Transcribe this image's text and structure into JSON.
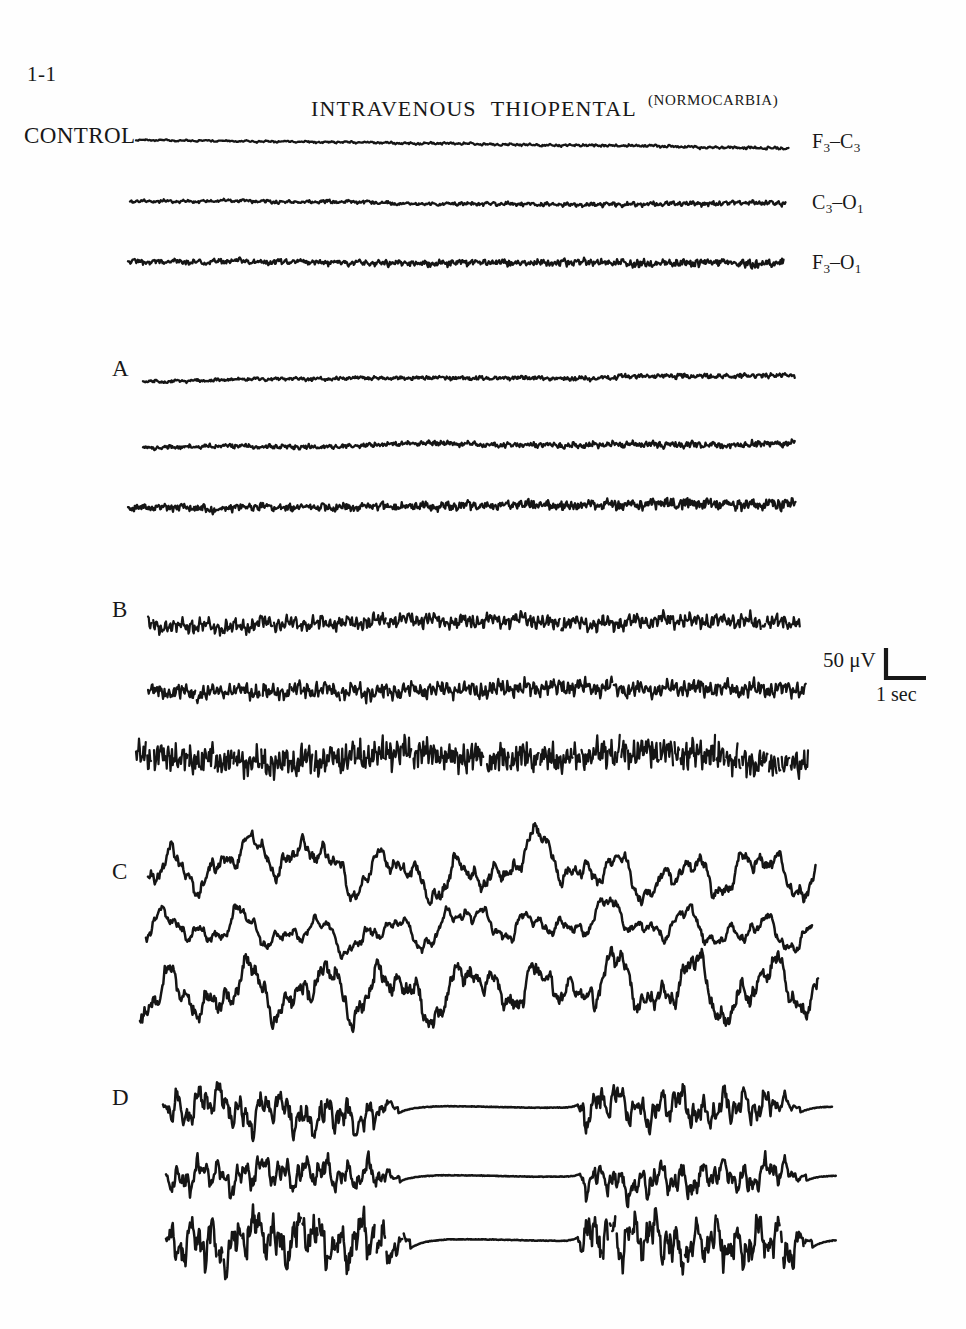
{
  "figure": {
    "number": "1-1",
    "control_label": "CONTROL",
    "title_main_part1": "INTRAVENOUS",
    "title_main_part2": "THIOPENTAL",
    "title_condition": "(NORMOCARBIA)"
  },
  "channels": [
    {
      "id": "f3-c3",
      "numerator": "F",
      "num_sub": "3",
      "dash": "–",
      "denominator": "C",
      "den_sub": "3",
      "full": "F3–C3"
    },
    {
      "id": "c3-o1",
      "numerator": "C",
      "num_sub": "3",
      "dash": "–",
      "denominator": "O",
      "den_sub": "1",
      "full": "C3–O1"
    },
    {
      "id": "f3-o1",
      "numerator": "F",
      "num_sub": "3",
      "dash": "–",
      "denominator": "O",
      "den_sub": "1",
      "full": "F3–O1"
    }
  ],
  "calibration": {
    "amplitude": "50 μV",
    "time": "1 sec"
  },
  "panels": [
    {
      "id": "control",
      "label": "",
      "label_visible": false
    },
    {
      "id": "a",
      "label": "A",
      "label_visible": true
    },
    {
      "id": "b",
      "label": "B",
      "label_visible": true
    },
    {
      "id": "c",
      "label": "C",
      "label_visible": true
    },
    {
      "id": "d",
      "label": "D",
      "label_visible": true
    }
  ],
  "colors": {
    "ink": "#181818",
    "trace": "#151515",
    "background": "#fefefe"
  },
  "chart_data": {
    "type": "line",
    "xlabel": "time",
    "ylabel": "amplitude (μV)",
    "grid": false,
    "legend_position": "right",
    "calibration_amplitude_uv": 50,
    "calibration_time_sec": 1,
    "channel_names": [
      "F3–C3",
      "C3–O1",
      "F3–O1"
    ],
    "panel_names": [
      "CONTROL",
      "A",
      "B",
      "C",
      "D"
    ],
    "panel_descriptions": [
      "CONTROL: low-voltage fast background activity, near-flat baseline",
      "A: low-voltage activity with occasional transients, increasing fast activity to the right",
      "B: prominent fast beta activity, high frequency, moderate amplitude",
      "C: high-amplitude slow delta activity, large slow waves",
      "D: burst-suppression pattern, bursts alternating with isoelectric suppression"
    ],
    "traces": [
      {
        "panel": "CONTROL",
        "channel": "F3–C3",
        "x_start_px": 136,
        "x_end_px": 789,
        "baseline_y_px": 140,
        "amplitude_scale": 0.26,
        "noise_density": 1.0,
        "style": "lowvolt-fast",
        "drift": [
          0,
          8
        ],
        "seed": 11
      },
      {
        "panel": "CONTROL",
        "channel": "C3–O1",
        "x_start_px": 130,
        "x_end_px": 786,
        "baseline_y_px": 201,
        "amplitude_scale": 0.42,
        "noise_density": 1.25,
        "style": "lowvolt-fast",
        "drift": [
          0,
          4
        ],
        "seed": 23
      },
      {
        "panel": "CONTROL",
        "channel": "F3–O1",
        "x_start_px": 128,
        "x_end_px": 784,
        "baseline_y_px": 261,
        "amplitude_scale": 0.62,
        "noise_density": 1.7,
        "style": "lowvolt-fast",
        "drift": [
          0,
          2
        ],
        "seed": 37
      },
      {
        "panel": "A",
        "channel": "F3–C3",
        "x_start_px": 143,
        "x_end_px": 795,
        "baseline_y_px": 381,
        "amplitude_scale": 0.4,
        "noise_density": 1.5,
        "style": "lowvolt-fast",
        "drift": [
          0,
          -6
        ],
        "seed": 53
      },
      {
        "panel": "A",
        "channel": "C3–O1",
        "x_start_px": 143,
        "x_end_px": 795,
        "baseline_y_px": 448,
        "amplitude_scale": 0.5,
        "noise_density": 1.7,
        "style": "lowvolt-fast",
        "drift": [
          0,
          -5
        ],
        "seed": 67
      },
      {
        "panel": "A",
        "channel": "F3–O1",
        "x_start_px": 128,
        "x_end_px": 796,
        "baseline_y_px": 508,
        "amplitude_scale": 0.72,
        "noise_density": 2.2,
        "style": "lowvolt-fast",
        "drift": [
          0,
          -4
        ],
        "seed": 79
      },
      {
        "panel": "B",
        "channel": "F3–C3",
        "x_start_px": 148,
        "x_end_px": 800,
        "baseline_y_px": 625,
        "amplitude_scale": 1.25,
        "noise_density": 3.4,
        "style": "beta-fast",
        "drift": [
          0,
          -6
        ],
        "seed": 97
      },
      {
        "panel": "B",
        "channel": "C3–O1",
        "x_start_px": 148,
        "x_end_px": 806,
        "baseline_y_px": 691,
        "amplitude_scale": 1.35,
        "noise_density": 3.6,
        "style": "beta-fast",
        "drift": [
          0,
          -3
        ],
        "seed": 113
      },
      {
        "panel": "B",
        "channel": "F3–O1",
        "x_start_px": 136,
        "x_end_px": 808,
        "baseline_y_px": 757,
        "amplitude_scale": 2.1,
        "noise_density": 5.0,
        "style": "beta-dense",
        "drift": [
          0,
          0
        ],
        "seed": 131
      },
      {
        "panel": "C",
        "channel": "F3–C3",
        "x_start_px": 148,
        "x_end_px": 816,
        "baseline_y_px": 874,
        "amplitude_scale": 2.6,
        "noise_density": 1.3,
        "style": "delta-slow",
        "drift": [
          0,
          0
        ],
        "seed": 149
      },
      {
        "panel": "C",
        "channel": "C3–O1",
        "x_start_px": 146,
        "x_end_px": 812,
        "baseline_y_px": 930,
        "amplitude_scale": 2.0,
        "noise_density": 1.2,
        "style": "delta-slow",
        "drift": [
          0,
          0
        ],
        "seed": 163
      },
      {
        "panel": "C",
        "channel": "F3–O1",
        "x_start_px": 140,
        "x_end_px": 818,
        "baseline_y_px": 992,
        "amplitude_scale": 3.2,
        "noise_density": 1.5,
        "style": "delta-slow",
        "drift": [
          0,
          0
        ],
        "seed": 181
      },
      {
        "panel": "D",
        "channel": "F3–C3",
        "x_start_px": 163,
        "x_end_px": 832,
        "baseline_y_px": 1107,
        "amplitude_scale": 2.3,
        "noise_density": 1.6,
        "style": "burst-suppression",
        "bursts": [
          [
            163,
            398
          ],
          [
            578,
            800
          ]
        ],
        "drift": [
          0,
          0
        ],
        "seed": 197
      },
      {
        "panel": "D",
        "channel": "C3–O1",
        "x_start_px": 166,
        "x_end_px": 836,
        "baseline_y_px": 1176,
        "amplitude_scale": 2.0,
        "noise_density": 1.6,
        "style": "burst-suppression",
        "bursts": [
          [
            166,
            400
          ],
          [
            580,
            806
          ]
        ],
        "drift": [
          0,
          0
        ],
        "seed": 211
      },
      {
        "panel": "D",
        "channel": "F3–O1",
        "x_start_px": 166,
        "x_end_px": 836,
        "baseline_y_px": 1240,
        "amplitude_scale": 3.1,
        "noise_density": 2.0,
        "style": "burst-suppression",
        "bursts": [
          [
            166,
            410
          ],
          [
            578,
            812
          ]
        ],
        "drift": [
          0,
          0
        ],
        "seed": 229
      }
    ],
    "annotations": [
      {
        "text": "1-1",
        "x_px": 27,
        "y_px": 64,
        "role": "figure-number"
      },
      {
        "text": "CONTROL",
        "x_px": 24,
        "y_px": 124,
        "role": "panel-label"
      },
      {
        "text": "INTRAVENOUS THIOPENTAL",
        "x_px": 311,
        "y_px": 98,
        "role": "title"
      },
      {
        "text": "(NORMOCARBIA)",
        "x_px": 648,
        "y_px": 93,
        "role": "subtitle"
      },
      {
        "text": "A",
        "x_px": 112,
        "y_px": 357,
        "role": "panel-label"
      },
      {
        "text": "B",
        "x_px": 112,
        "y_px": 598,
        "role": "panel-label"
      },
      {
        "text": "C",
        "x_px": 112,
        "y_px": 860,
        "role": "panel-label"
      },
      {
        "text": "D",
        "x_px": 112,
        "y_px": 1086,
        "role": "panel-label"
      },
      {
        "text": "F3–C3",
        "x_px": 812,
        "y_px": 131,
        "role": "channel-label"
      },
      {
        "text": "C3–O1",
        "x_px": 812,
        "y_px": 192,
        "role": "channel-label"
      },
      {
        "text": "F3–O1",
        "x_px": 812,
        "y_px": 252,
        "role": "channel-label"
      },
      {
        "text": "50 μV",
        "x_px": 823,
        "y_px": 650,
        "role": "calibration"
      },
      {
        "text": "1 sec",
        "x_px": 876,
        "y_px": 684,
        "role": "calibration"
      }
    ]
  }
}
